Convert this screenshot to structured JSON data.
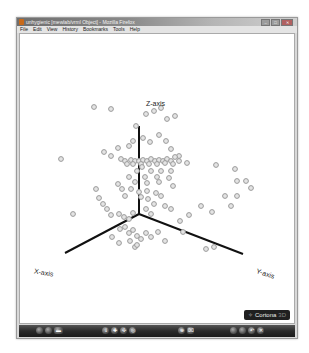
{
  "window": {
    "title": "unhygienic [mewlab/vrml Object] - Mozilla Firefox",
    "controls": {
      "minimize": "–",
      "maximize": "□",
      "close": "✕"
    }
  },
  "menubar": {
    "items": [
      {
        "label": "File"
      },
      {
        "label": "Edit"
      },
      {
        "label": "View"
      },
      {
        "label": "History"
      },
      {
        "label": "Bookmarks"
      },
      {
        "label": "Tools"
      },
      {
        "label": "Help"
      }
    ]
  },
  "scene": {
    "axes": {
      "z_label": "Z-axis",
      "x_label": "X-axis",
      "y_label": "Y-axis"
    },
    "origin": [
      138,
      213
    ],
    "axis_color": "#111111",
    "point_color": "#9a9a9a",
    "points": [
      [
        93,
        106
      ],
      [
        110,
        108
      ],
      [
        135,
        125
      ],
      [
        153,
        110
      ],
      [
        160,
        107
      ],
      [
        174,
        115
      ],
      [
        166,
        118
      ],
      [
        145,
        113
      ],
      [
        132,
        140
      ],
      [
        142,
        137
      ],
      [
        149,
        141
      ],
      [
        128,
        145
      ],
      [
        117,
        147
      ],
      [
        158,
        134
      ],
      [
        165,
        140
      ],
      [
        170,
        148
      ],
      [
        178,
        155
      ],
      [
        186,
        162
      ],
      [
        60,
        158
      ],
      [
        103,
        151
      ],
      [
        110,
        155
      ],
      [
        120,
        158
      ],
      [
        124,
        160
      ],
      [
        130,
        159
      ],
      [
        134,
        160
      ],
      [
        138,
        160
      ],
      [
        142,
        159
      ],
      [
        146,
        160
      ],
      [
        150,
        158
      ],
      [
        154,
        160
      ],
      [
        158,
        159
      ],
      [
        162,
        160
      ],
      [
        166,
        158
      ],
      [
        170,
        160
      ],
      [
        174,
        156
      ],
      [
        178,
        160
      ],
      [
        126,
        163
      ],
      [
        132,
        163
      ],
      [
        140,
        163
      ],
      [
        148,
        163
      ],
      [
        156,
        163
      ],
      [
        164,
        162
      ],
      [
        172,
        163
      ],
      [
        215,
        164
      ],
      [
        234,
        168
      ],
      [
        236,
        180
      ],
      [
        141,
        166
      ],
      [
        136,
        170
      ],
      [
        150,
        170
      ],
      [
        160,
        170
      ],
      [
        170,
        170
      ],
      [
        144,
        176
      ],
      [
        156,
        176
      ],
      [
        128,
        176
      ],
      [
        134,
        181
      ],
      [
        146,
        182
      ],
      [
        158,
        181
      ],
      [
        168,
        177
      ],
      [
        172,
        185
      ],
      [
        130,
        188
      ],
      [
        138,
        191
      ],
      [
        146,
        190
      ],
      [
        155,
        192
      ],
      [
        160,
        195
      ],
      [
        117,
        183
      ],
      [
        121,
        188
      ],
      [
        124,
        195
      ],
      [
        140,
        196
      ],
      [
        147,
        198
      ],
      [
        153,
        203
      ],
      [
        164,
        205
      ],
      [
        170,
        208
      ],
      [
        98,
        197
      ],
      [
        102,
        203
      ],
      [
        106,
        208
      ],
      [
        110,
        214
      ],
      [
        118,
        213
      ],
      [
        123,
        216
      ],
      [
        128,
        218
      ],
      [
        132,
        212
      ],
      [
        145,
        208
      ],
      [
        150,
        213
      ],
      [
        72,
        213
      ],
      [
        95,
        188
      ],
      [
        200,
        205
      ],
      [
        211,
        211
      ],
      [
        224,
        195
      ],
      [
        236,
        195
      ],
      [
        230,
        205
      ],
      [
        245,
        180
      ],
      [
        250,
        187
      ],
      [
        119,
        228
      ],
      [
        124,
        226
      ],
      [
        128,
        232
      ],
      [
        132,
        229
      ],
      [
        136,
        235
      ],
      [
        140,
        238
      ],
      [
        145,
        232
      ],
      [
        111,
        236
      ],
      [
        118,
        242
      ],
      [
        129,
        240
      ],
      [
        134,
        246
      ],
      [
        136,
        244
      ],
      [
        150,
        236
      ],
      [
        157,
        231
      ],
      [
        164,
        240
      ],
      [
        179,
        220
      ],
      [
        188,
        214
      ],
      [
        182,
        231
      ],
      [
        205,
        248
      ],
      [
        213,
        246
      ]
    ]
  },
  "badge": {
    "label": "Cortona",
    "suffix": "3D"
  },
  "toolbar": {
    "left_buttons": [
      "nav-back",
      "nav-forward",
      "view"
    ],
    "center_buttons": [
      "walk",
      "plan",
      "study",
      "fly"
    ],
    "mid_buttons": [
      "fit",
      "align"
    ],
    "right_buttons": [
      "prev-viewpoint",
      "next-viewpoint",
      "undo",
      "restore"
    ]
  }
}
